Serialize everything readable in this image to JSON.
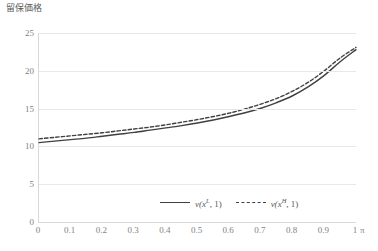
{
  "chart_data": {
    "type": "line",
    "title": "",
    "ylabel": "留保価格",
    "xlabel": "",
    "x_unit": "π",
    "xlim": [
      0,
      1
    ],
    "ylim": [
      0,
      25
    ],
    "grid": true,
    "legend_position": "bottom-center",
    "x_ticks": [
      "0",
      "0.1",
      "0.2",
      "0.3",
      "0.4",
      "0.5",
      "0.6",
      "0.7",
      "0.8",
      "0.9",
      "1"
    ],
    "y_ticks": [
      "0",
      "5",
      "10",
      "15",
      "20",
      "25"
    ],
    "x": [
      0,
      0.05,
      0.1,
      0.15,
      0.2,
      0.25,
      0.3,
      0.35,
      0.4,
      0.45,
      0.5,
      0.55,
      0.6,
      0.65,
      0.7,
      0.75,
      0.8,
      0.85,
      0.9,
      0.95,
      1.0
    ],
    "series": [
      {
        "name": "v(x^L, 1)",
        "style": "solid",
        "color": "#404040",
        "values": [
          10.5,
          10.7,
          10.9,
          11.1,
          11.35,
          11.6,
          11.85,
          12.15,
          12.45,
          12.75,
          13.1,
          13.5,
          13.95,
          14.45,
          15.05,
          15.8,
          16.7,
          17.9,
          19.4,
          21.2,
          22.8
        ]
      },
      {
        "name": "v(x^H, 1)",
        "style": "dashed",
        "color": "#404040",
        "values": [
          11.0,
          11.2,
          11.4,
          11.6,
          11.8,
          12.05,
          12.3,
          12.55,
          12.85,
          13.2,
          13.55,
          13.95,
          14.4,
          14.95,
          15.6,
          16.35,
          17.3,
          18.5,
          20.0,
          21.7,
          23.1
        ]
      }
    ]
  },
  "legend": {
    "entries": [
      {
        "prefix": "v(",
        "base": "x",
        "sup": "L",
        "suffix": ", 1)",
        "style": "solid"
      },
      {
        "prefix": "v(",
        "base": "x",
        "sup": "H",
        "suffix": ", 1)",
        "style": "dashed"
      }
    ]
  }
}
